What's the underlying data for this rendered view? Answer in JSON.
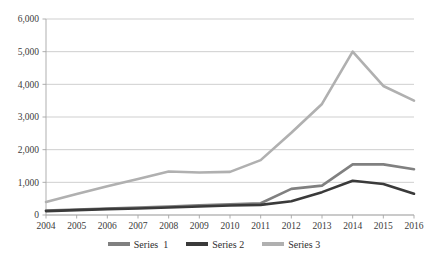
{
  "chart_data": {
    "type": "line",
    "title": "",
    "xlabel": "",
    "ylabel": "",
    "categories": [
      "2004",
      "2005",
      "2006",
      "2007",
      "2008",
      "2009",
      "2010",
      "2011",
      "2012",
      "2013",
      "2014",
      "2015",
      "2016"
    ],
    "x": [
      2004,
      2005,
      2006,
      2007,
      2008,
      2009,
      2010,
      2011,
      2012,
      2013,
      2014,
      2015,
      2016
    ],
    "ylim": [
      0,
      6000
    ],
    "xlim": [
      2004,
      2016
    ],
    "ytick_labels": [
      "0",
      "1,000",
      "2,000",
      "3,000",
      "4,000",
      "5,000",
      "6,000"
    ],
    "ytick_values": [
      0,
      1000,
      2000,
      3000,
      4000,
      5000,
      6000
    ],
    "grid": true,
    "legend_position": "bottom",
    "series": [
      {
        "name": "Series  1",
        "color": "#808080",
        "values": [
          140,
          170,
          200,
          230,
          260,
          300,
          330,
          360,
          800,
          900,
          1550,
          1550,
          1400
        ]
      },
      {
        "name": "Series 2",
        "color": "#3a3a3a",
        "values": [
          120,
          150,
          180,
          200,
          230,
          260,
          290,
          310,
          420,
          700,
          1050,
          950,
          650
        ]
      },
      {
        "name": "Series 3",
        "color": "#b0b0b0",
        "values": [
          400,
          640,
          880,
          1100,
          1330,
          1300,
          1320,
          1680,
          2520,
          3400,
          5000,
          3950,
          3500
        ]
      }
    ]
  },
  "legend": {
    "items": [
      {
        "label": "Series  1",
        "color": "#808080"
      },
      {
        "label": "Series 2",
        "color": "#3a3a3a"
      },
      {
        "label": "Series 3",
        "color": "#b0b0b0"
      }
    ]
  },
  "colors": {
    "gridline": "#c9c9c9",
    "axis": "#a6a6a6",
    "tick_text": "#3b3b3b",
    "background": "#ffffff"
  }
}
